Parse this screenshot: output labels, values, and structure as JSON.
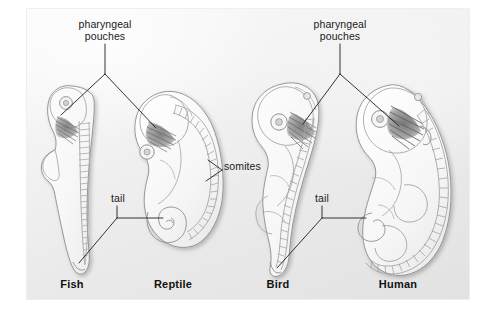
{
  "figure": {
    "background_color": "#ffffff",
    "panel_color": "#eeeeee",
    "ink_color": "#1a1a1a"
  },
  "callouts": [
    {
      "id": "pharyngeal_pouches_left",
      "text": "pharyngeal\npouches",
      "line1": "pharyngeal",
      "line2": "pouches",
      "points_to": [
        "Fish",
        "Reptile"
      ]
    },
    {
      "id": "pharyngeal_pouches_right",
      "text": "pharyngeal\npouches",
      "line1": "pharyngeal",
      "line2": "pouches",
      "points_to": [
        "Bird",
        "Human"
      ]
    },
    {
      "id": "somites",
      "text": "somites",
      "points_to": [
        "Reptile",
        "Bird"
      ]
    },
    {
      "id": "tail_left",
      "text": "tail",
      "points_to": [
        "Fish",
        "Reptile"
      ]
    },
    {
      "id": "tail_right",
      "text": "tail",
      "points_to": [
        "Bird",
        "Human"
      ]
    }
  ],
  "specimens": [
    {
      "id": "fish",
      "label": "Fish"
    },
    {
      "id": "reptile",
      "label": "Reptile"
    },
    {
      "id": "bird",
      "label": "Bird"
    },
    {
      "id": "human",
      "label": "Human"
    }
  ]
}
